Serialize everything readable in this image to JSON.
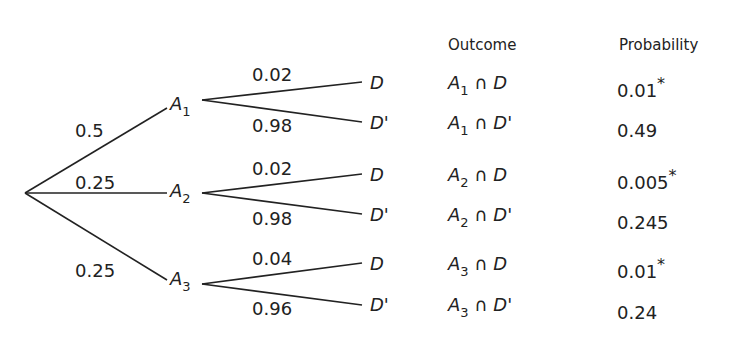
{
  "headers": {
    "outcome": "Outcome",
    "probability": "Probability"
  },
  "root_branches": [
    {
      "label": "0.5",
      "node": "A",
      "sub": "1"
    },
    {
      "label": "0.25",
      "node": "A",
      "sub": "2"
    },
    {
      "label": "0.25",
      "node": "A",
      "sub": "3"
    }
  ],
  "sub_branches": [
    {
      "p": "0.02",
      "end": "D"
    },
    {
      "p": "0.98",
      "end": "D'"
    },
    {
      "p": "0.02",
      "end": "D"
    },
    {
      "p": "0.98",
      "end": "D'"
    },
    {
      "p": "0.04",
      "end": "D"
    },
    {
      "p": "0.96",
      "end": "D'"
    }
  ],
  "rows": [
    {
      "a": "A",
      "sub": "1",
      "cap": "∩",
      "d": "D",
      "prob": "0.01",
      "star": "*"
    },
    {
      "a": "A",
      "sub": "1",
      "cap": "∩",
      "d": "D'",
      "prob": "0.49",
      "star": ""
    },
    {
      "a": "A",
      "sub": "2",
      "cap": "∩",
      "d": "D",
      "prob": "0.005",
      "star": "*"
    },
    {
      "a": "A",
      "sub": "2",
      "cap": "∩",
      "d": "D'",
      "prob": "0.245",
      "star": ""
    },
    {
      "a": "A",
      "sub": "3",
      "cap": "∩",
      "d": "D",
      "prob": "0.01",
      "star": "*"
    },
    {
      "a": "A",
      "sub": "3",
      "cap": "∩",
      "d": "D'",
      "prob": "0.24",
      "star": ""
    }
  ]
}
